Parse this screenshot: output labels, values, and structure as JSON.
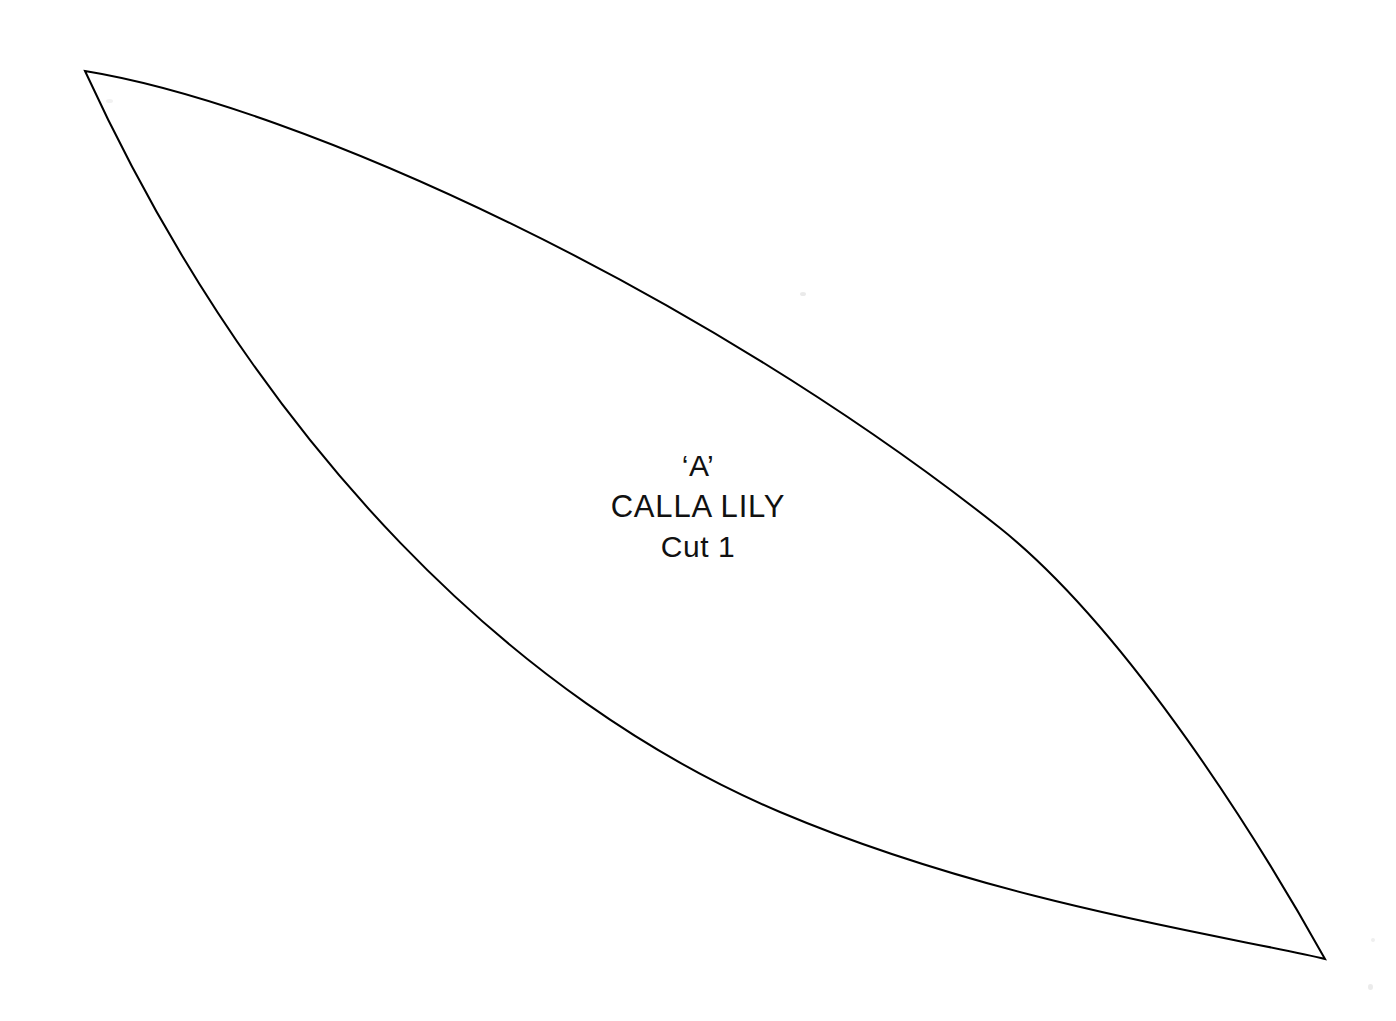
{
  "document": {
    "kind": "sewing-pattern-template",
    "background_color": "#ffffff",
    "width": 1396,
    "height": 1021
  },
  "pattern_piece": {
    "outline_color": "#000000",
    "outline_width": 2,
    "fill_color": "#ffffff",
    "shape": "pointed-leaf-lens",
    "tip_start": "85, 71",
    "tip_end": "1325, 959",
    "path": "M 85 71 C 300 106 700 290 1000 528 C 1130 632 1262 846 1325 959 C 1240 938 1000 905 780 812 C 520 702 260 452 85 71 Z"
  },
  "labels": {
    "piece_letter": "‘A’",
    "pattern_name": "CALLA LILY",
    "cut_instruction": "Cut 1"
  }
}
